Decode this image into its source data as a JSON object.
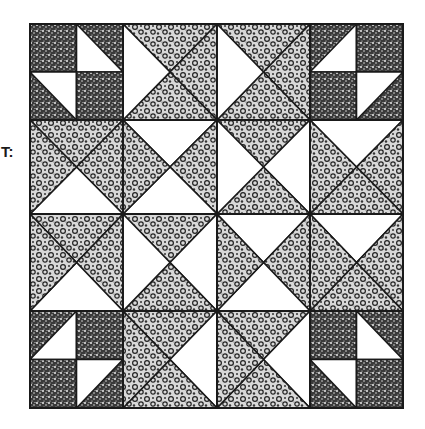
{
  "label": "T:",
  "colors": {
    "outline": "#1a1a1a",
    "white": "#ffffff",
    "dark_print": "#2a2a2a",
    "light_print": "#8a8a8a"
  },
  "quilt": {
    "bounds": {
      "x0": 30,
      "y0": 24,
      "x1": 403,
      "y1": 408
    },
    "cols": [
      30,
      123,
      217,
      310,
      403
    ],
    "rows": [
      24,
      120,
      214,
      311,
      408
    ],
    "qst_cells": [
      {
        "r": 0,
        "c": 1,
        "T": "P",
        "R": "P",
        "B": "P",
        "L": "W"
      },
      {
        "r": 0,
        "c": 2,
        "T": "P",
        "R": "P",
        "B": "P",
        "L": "W"
      },
      {
        "r": 1,
        "c": 0,
        "T": "P",
        "R": "P",
        "B": "W",
        "L": "P"
      },
      {
        "r": 1,
        "c": 1,
        "T": "W",
        "R": "P",
        "B": "W",
        "L": "P"
      },
      {
        "r": 1,
        "c": 2,
        "T": "P",
        "R": "W",
        "B": "P",
        "L": "W"
      },
      {
        "r": 1,
        "c": 3,
        "T": "W",
        "R": "P",
        "B": "P",
        "L": "P"
      },
      {
        "r": 2,
        "c": 0,
        "T": "P",
        "R": "P",
        "B": "W",
        "L": "P"
      },
      {
        "r": 2,
        "c": 1,
        "T": "P",
        "R": "W",
        "B": "P",
        "L": "W"
      },
      {
        "r": 2,
        "c": 2,
        "T": "W",
        "R": "P",
        "B": "W",
        "L": "P"
      },
      {
        "r": 2,
        "c": 3,
        "T": "W",
        "R": "P",
        "B": "P",
        "L": "P"
      },
      {
        "r": 3,
        "c": 1,
        "T": "P",
        "R": "W",
        "B": "P",
        "L": "P"
      },
      {
        "r": 3,
        "c": 2,
        "T": "P",
        "R": "W",
        "B": "P",
        "L": "P"
      }
    ],
    "corner_blocks": [
      {
        "r": 0,
        "c": 0,
        "subs": [
          "D",
          "W:tl-bl-br",
          "W:tl-tr-br",
          "D"
        ]
      },
      {
        "r": 0,
        "c": 3,
        "subs": [
          "W:tr-br-bl",
          "D",
          "D",
          "W:tl-tr-bl"
        ]
      },
      {
        "r": 3,
        "c": 0,
        "subs": [
          "W:tr-br-bl",
          "D",
          "D",
          "W:tl-tr-bl"
        ]
      },
      {
        "r": 3,
        "c": 3,
        "subs": [
          "D",
          "W:tl-bl-br",
          "W:tl-tr-br",
          "D"
        ]
      }
    ]
  }
}
